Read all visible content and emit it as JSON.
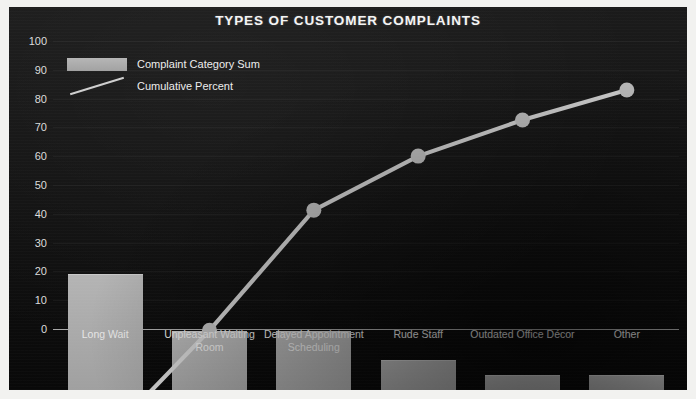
{
  "chart_data": {
    "type": "bar",
    "title": "TYPES OF CUSTOMER COMPLAINTS",
    "xlabel": "",
    "ylabel": "",
    "ylim": [
      0,
      100
    ],
    "yticks": [
      0,
      10,
      20,
      30,
      40,
      50,
      60,
      70,
      80,
      90,
      100
    ],
    "grid": true,
    "legend_position": "top-left",
    "categories": [
      "Long Wait",
      "Unpleasant Waiting Room",
      "Delayed Appointment Scheduling",
      "Rude Staff",
      "Outdated Office Décor",
      "Other"
    ],
    "series": [
      {
        "name": "Complaint Category Sum",
        "type": "bar",
        "color": "#aaaaaa",
        "values": [
          40,
          20,
          20,
          10,
          5,
          5
        ]
      },
      {
        "name": "Cumulative Percent",
        "type": "line",
        "color": "#cfcfcf",
        "values": [
          40,
          58,
          78,
          87,
          93,
          98
        ]
      }
    ]
  },
  "legend": {
    "items": [
      {
        "label": "Complaint Category Sum"
      },
      {
        "label": "Cumulative Percent"
      }
    ]
  },
  "colors": {
    "background": "#141414",
    "bar": "#a8a8a8",
    "line": "#cfcfcf",
    "text": "#ededed",
    "frame": "#f2f2f0"
  }
}
